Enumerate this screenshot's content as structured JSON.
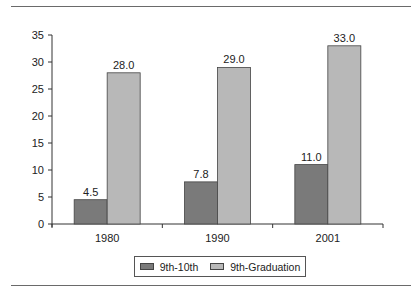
{
  "chart_data": {
    "type": "bar",
    "title": "",
    "xlabel": "",
    "ylabel": "",
    "categories": [
      "1980",
      "1990",
      "2001"
    ],
    "series": [
      {
        "name": "9th-10th",
        "values": [
          4.5,
          7.8,
          11.0
        ],
        "labels": [
          "4.5",
          "7.8",
          "11.0"
        ],
        "color": "#7a7a7a"
      },
      {
        "name": "9th-Graduation",
        "values": [
          28.0,
          29.0,
          33.0
        ],
        "labels": [
          "28.0",
          "29.0",
          "33.0"
        ],
        "color": "#b8b8b8"
      }
    ],
    "ylim": [
      0,
      35
    ],
    "yticks": [
      "0",
      "5",
      "10",
      "15",
      "20",
      "25",
      "30",
      "35"
    ],
    "grid": false,
    "legend_position": "bottom"
  },
  "legend": {
    "items": [
      {
        "label": "9th-10th",
        "color": "#7a7a7a"
      },
      {
        "label": "9th-Graduation",
        "color": "#b8b8b8"
      }
    ]
  }
}
